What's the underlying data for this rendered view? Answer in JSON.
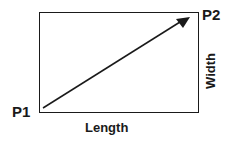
{
  "diagram": {
    "type": "rectangle-with-diagonal-vector",
    "labels": {
      "start_point": "P1",
      "end_point": "P2",
      "horizontal_side": "Length",
      "vertical_side": "Width"
    },
    "colors": {
      "stroke": "#1a1a1a",
      "background": "#ffffff"
    }
  }
}
